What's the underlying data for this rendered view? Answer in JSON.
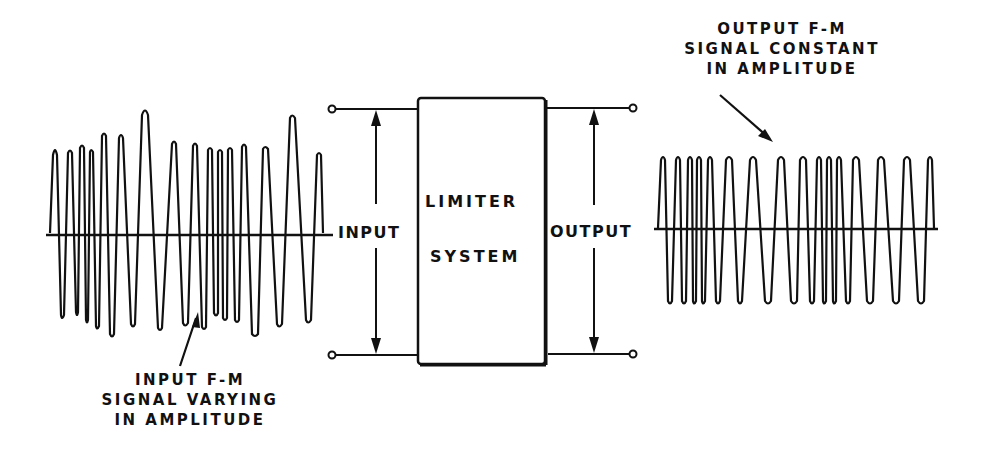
{
  "diagram": {
    "block": {
      "line1": "LIMITER",
      "line2": "SYSTEM"
    },
    "terminals": {
      "input_label": "INPUT",
      "output_label": "OUTPUT"
    },
    "input_signal_caption": [
      "INPUT F-M",
      "SIGNAL VARYING",
      "IN AMPLITUDE"
    ],
    "output_signal_caption": [
      "OUTPUT F-M",
      "SIGNAL CONSTANT",
      "IN AMPLITUDE"
    ],
    "colors": {
      "ink": "#111111",
      "background": "#ffffff"
    }
  }
}
